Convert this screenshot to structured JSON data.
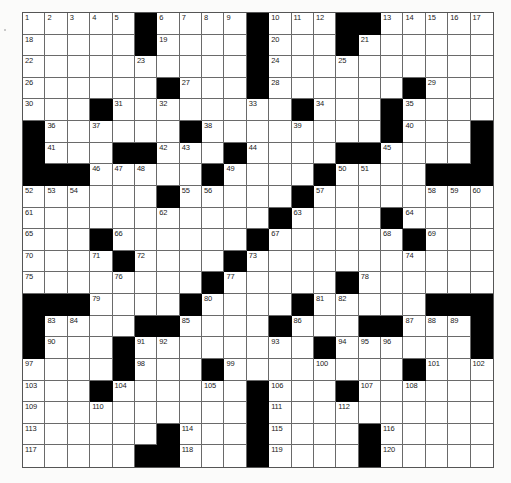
{
  "puzzle": {
    "rows": 21,
    "cols": 21,
    "colors": {
      "block": "#000000",
      "cell": "#ffffff",
      "line": "#6a6a6a",
      "background": "#fbfbfa",
      "number": "#222222"
    },
    "layout": [
      ".....#....#...##.....",
      ".....#....#...#......",
      "..........#..........",
      "......#...#......#...",
      "...#........#...#....",
      "#......#........#...#",
      "#...##...#....##....#",
      "###.....#....#....###",
      "......#.....#........",
      "...........#....#....",
      "...#......#......#...",
      "....#....#...........",
      "........#.....#......",
      "###....#....#.....###",
      "#....##....#...##...#",
      "#...#........#......#",
      "....#...#........#...",
      "...#......#...#......",
      "..........#..........",
      "......#...#....#.....",
      ".....##...#....#....."
    ],
    "numbered_cells": [
      {
        "n": "1",
        "r": 0,
        "c": 0
      },
      {
        "n": "2",
        "r": 0,
        "c": 1
      },
      {
        "n": "3",
        "r": 0,
        "c": 2
      },
      {
        "n": "4",
        "r": 0,
        "c": 3
      },
      {
        "n": "5",
        "r": 0,
        "c": 4
      },
      {
        "n": "6",
        "r": 0,
        "c": 6
      },
      {
        "n": "7",
        "r": 0,
        "c": 7
      },
      {
        "n": "8",
        "r": 0,
        "c": 8
      },
      {
        "n": "9",
        "r": 0,
        "c": 9
      },
      {
        "n": "10",
        "r": 0,
        "c": 11
      },
      {
        "n": "11",
        "r": 0,
        "c": 12
      },
      {
        "n": "12",
        "r": 0,
        "c": 13
      },
      {
        "n": "13",
        "r": 0,
        "c": 16
      },
      {
        "n": "14",
        "r": 0,
        "c": 17
      },
      {
        "n": "15",
        "r": 0,
        "c": 18
      },
      {
        "n": "16",
        "r": 0,
        "c": 19
      },
      {
        "n": "17",
        "r": 0,
        "c": 20
      },
      {
        "n": "18",
        "r": 1,
        "c": 0
      },
      {
        "n": "19",
        "r": 1,
        "c": 6
      },
      {
        "n": "20",
        "r": 1,
        "c": 11
      },
      {
        "n": "21",
        "r": 1,
        "c": 15
      },
      {
        "n": "22",
        "r": 2,
        "c": 0
      },
      {
        "n": "23",
        "r": 2,
        "c": 5
      },
      {
        "n": "24",
        "r": 2,
        "c": 11
      },
      {
        "n": "25",
        "r": 2,
        "c": 14
      },
      {
        "n": "26",
        "r": 3,
        "c": 0
      },
      {
        "n": "27",
        "r": 3,
        "c": 7
      },
      {
        "n": "28",
        "r": 3,
        "c": 11
      },
      {
        "n": "29",
        "r": 3,
        "c": 18
      },
      {
        "n": "30",
        "r": 4,
        "c": 0
      },
      {
        "n": "31",
        "r": 4,
        "c": 4
      },
      {
        "n": "32",
        "r": 4,
        "c": 6
      },
      {
        "n": "33",
        "r": 4,
        "c": 10
      },
      {
        "n": "34",
        "r": 4,
        "c": 13
      },
      {
        "n": "35",
        "r": 4,
        "c": 17
      },
      {
        "n": "36",
        "r": 5,
        "c": 1
      },
      {
        "n": "37",
        "r": 5,
        "c": 3
      },
      {
        "n": "38",
        "r": 5,
        "c": 8
      },
      {
        "n": "39",
        "r": 5,
        "c": 12
      },
      {
        "n": "40",
        "r": 5,
        "c": 17
      },
      {
        "n": "41",
        "r": 6,
        "c": 1
      },
      {
        "n": "42",
        "r": 6,
        "c": 6
      },
      {
        "n": "43",
        "r": 6,
        "c": 7
      },
      {
        "n": "44",
        "r": 6,
        "c": 10
      },
      {
        "n": "45",
        "r": 6,
        "c": 16
      },
      {
        "n": "46",
        "r": 7,
        "c": 3
      },
      {
        "n": "47",
        "r": 7,
        "c": 4
      },
      {
        "n": "48",
        "r": 7,
        "c": 5
      },
      {
        "n": "49",
        "r": 7,
        "c": 9
      },
      {
        "n": "50",
        "r": 7,
        "c": 14
      },
      {
        "n": "51",
        "r": 7,
        "c": 15
      },
      {
        "n": "52",
        "r": 8,
        "c": 0
      },
      {
        "n": "53",
        "r": 8,
        "c": 1
      },
      {
        "n": "54",
        "r": 8,
        "c": 2
      },
      {
        "n": "55",
        "r": 8,
        "c": 7
      },
      {
        "n": "56",
        "r": 8,
        "c": 8
      },
      {
        "n": "57",
        "r": 8,
        "c": 13
      },
      {
        "n": "58",
        "r": 8,
        "c": 18
      },
      {
        "n": "59",
        "r": 8,
        "c": 19
      },
      {
        "n": "60",
        "r": 8,
        "c": 20
      },
      {
        "n": "61",
        "r": 9,
        "c": 0
      },
      {
        "n": "62",
        "r": 9,
        "c": 6
      },
      {
        "n": "63",
        "r": 9,
        "c": 12
      },
      {
        "n": "64",
        "r": 9,
        "c": 17
      },
      {
        "n": "65",
        "r": 10,
        "c": 0
      },
      {
        "n": "66",
        "r": 10,
        "c": 4
      },
      {
        "n": "67",
        "r": 10,
        "c": 11
      },
      {
        "n": "68",
        "r": 10,
        "c": 16
      },
      {
        "n": "69",
        "r": 10,
        "c": 18
      },
      {
        "n": "70",
        "r": 11,
        "c": 0
      },
      {
        "n": "71",
        "r": 11,
        "c": 3
      },
      {
        "n": "72",
        "r": 11,
        "c": 5
      },
      {
        "n": "73",
        "r": 11,
        "c": 10
      },
      {
        "n": "74",
        "r": 11,
        "c": 17
      },
      {
        "n": "75",
        "r": 12,
        "c": 0
      },
      {
        "n": "76",
        "r": 12,
        "c": 4
      },
      {
        "n": "77",
        "r": 12,
        "c": 9
      },
      {
        "n": "78",
        "r": 12,
        "c": 15
      },
      {
        "n": "79",
        "r": 13,
        "c": 3
      },
      {
        "n": "80",
        "r": 13,
        "c": 8
      },
      {
        "n": "81",
        "r": 13,
        "c": 13
      },
      {
        "n": "82",
        "r": 13,
        "c": 14
      },
      {
        "n": "83",
        "r": 14,
        "c": 1
      },
      {
        "n": "84",
        "r": 14,
        "c": 2
      },
      {
        "n": "85",
        "r": 14,
        "c": 7
      },
      {
        "n": "86",
        "r": 14,
        "c": 12
      },
      {
        "n": "87",
        "r": 14,
        "c": 17
      },
      {
        "n": "88",
        "r": 14,
        "c": 18
      },
      {
        "n": "89",
        "r": 14,
        "c": 19
      },
      {
        "n": "90",
        "r": 15,
        "c": 1
      },
      {
        "n": "91",
        "r": 15,
        "c": 5
      },
      {
        "n": "92",
        "r": 15,
        "c": 6
      },
      {
        "n": "93",
        "r": 15,
        "c": 11
      },
      {
        "n": "94",
        "r": 15,
        "c": 14
      },
      {
        "n": "95",
        "r": 15,
        "c": 15
      },
      {
        "n": "96",
        "r": 15,
        "c": 16
      },
      {
        "n": "97",
        "r": 16,
        "c": 0
      },
      {
        "n": "98",
        "r": 16,
        "c": 5
      },
      {
        "n": "99",
        "r": 16,
        "c": 9
      },
      {
        "n": "100",
        "r": 16,
        "c": 13
      },
      {
        "n": "101",
        "r": 16,
        "c": 18
      },
      {
        "n": "102",
        "r": 16,
        "c": 20
      },
      {
        "n": "103",
        "r": 17,
        "c": 0
      },
      {
        "n": "104",
        "r": 17,
        "c": 4
      },
      {
        "n": "105",
        "r": 17,
        "c": 8
      },
      {
        "n": "106",
        "r": 17,
        "c": 11
      },
      {
        "n": "107",
        "r": 17,
        "c": 15
      },
      {
        "n": "108",
        "r": 17,
        "c": 17
      },
      {
        "n": "109",
        "r": 18,
        "c": 0
      },
      {
        "n": "110",
        "r": 18,
        "c": 3
      },
      {
        "n": "111",
        "r": 18,
        "c": 11
      },
      {
        "n": "112",
        "r": 18,
        "c": 14
      },
      {
        "n": "113",
        "r": 19,
        "c": 0
      },
      {
        "n": "114",
        "r": 19,
        "c": 7
      },
      {
        "n": "115",
        "r": 19,
        "c": 11
      },
      {
        "n": "116",
        "r": 19,
        "c": 16
      },
      {
        "n": "117",
        "r": 20,
        "c": 0
      },
      {
        "n": "118",
        "r": 20,
        "c": 7
      },
      {
        "n": "119",
        "r": 20,
        "c": 11
      },
      {
        "n": "120",
        "r": 20,
        "c": 16
      }
    ]
  }
}
